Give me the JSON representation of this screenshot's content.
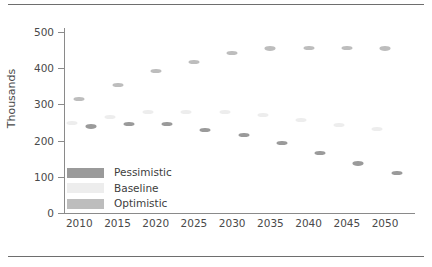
{
  "chart_data": {
    "type": "scatter",
    "title": "",
    "subtitle": "",
    "xlabel": "",
    "ylabel": "Thousands",
    "x": [
      2010,
      2015,
      2020,
      2025,
      2030,
      2035,
      2040,
      2045,
      2050
    ],
    "categories": [
      "2010",
      "2015",
      "2020",
      "2025",
      "2030",
      "2035",
      "2040",
      "2045",
      "2050"
    ],
    "xtick_labels": [
      "2010",
      "2015",
      "2020",
      "2025",
      "2030",
      "2035",
      "2040",
      "2045",
      "2050"
    ],
    "ytick_labels": [
      "0",
      "100",
      "200",
      "300",
      "400",
      "500"
    ],
    "ytick_values": [
      0,
      100,
      200,
      300,
      400,
      500
    ],
    "ylim": [
      0,
      500
    ],
    "xlim": [
      2008,
      2053
    ],
    "grid": false,
    "legend_position": "bottom-left",
    "series": [
      {
        "name": "Pessimistic",
        "color": "#9a9a9a",
        "x_offset": 1.5,
        "values": [
          239,
          246,
          246,
          230,
          215,
          193,
          166,
          137,
          110
        ]
      },
      {
        "name": "Baseline",
        "color": "#ededed",
        "x_offset": -1.0,
        "values": [
          248,
          265,
          278,
          278,
          278,
          270,
          258,
          243,
          231
        ]
      },
      {
        "name": "Optimistic",
        "color": "#bdbdbd",
        "x_offset": 0.0,
        "values": [
          315,
          353,
          393,
          418,
          441,
          454,
          456,
          456,
          454
        ]
      }
    ],
    "legend": [
      {
        "label": "Pessimistic",
        "color": "#9a9a9a"
      },
      {
        "label": "Baseline",
        "color": "#ededed"
      },
      {
        "label": "Optimistic",
        "color": "#bdbdbd"
      }
    ],
    "axis_color": "#8a8a8a",
    "text_color": "#4a4a4a",
    "background": "#ffffff"
  }
}
